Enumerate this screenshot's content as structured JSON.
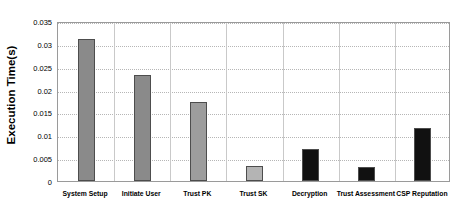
{
  "chart_data": {
    "type": "bar",
    "title": "",
    "xlabel": "",
    "ylabel": "Execution Time(s)",
    "categories": [
      "System Setup",
      "Initiate User",
      "Trust PK",
      "Trust SK",
      "Decryption",
      "Trust Assessment",
      "CSP Reputation"
    ],
    "values": [
      0.031,
      0.0233,
      0.0172,
      0.0033,
      0.007,
      0.003,
      0.0117
    ],
    "bar_colors": [
      "#8a8a8a",
      "#8a8a8a",
      "#9d9d9d",
      "#b4b4b4",
      "#111111",
      "#111111",
      "#111111"
    ],
    "bar_border_color": "#4d4d4d",
    "ylim": [
      0,
      0.035
    ],
    "ytick_step": 0.005,
    "ytick_labels": [
      "0",
      "0.005",
      "0.01",
      "0.015",
      "0.02",
      "0.025",
      "0.03",
      "0.035"
    ],
    "ytick_values": [
      0,
      0.005,
      0.01,
      0.015,
      0.02,
      0.025,
      0.03,
      0.035
    ],
    "grid": {
      "horizontal": true,
      "vertical": true,
      "horizontal_style": "dotted",
      "vertical_style": "solid"
    },
    "legend": null,
    "legend_position": "none",
    "plot_background": "#ffffff",
    "axis_color": "#9a9a9a"
  }
}
